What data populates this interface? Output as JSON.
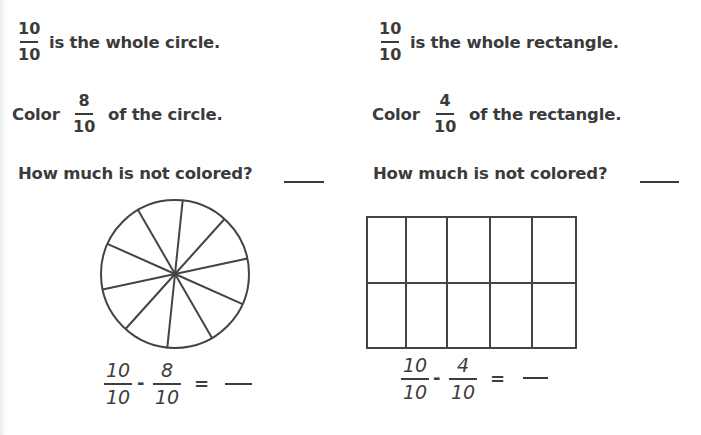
{
  "left": {
    "whole": {
      "numerator": "10",
      "denominator": "10",
      "text": "is the whole circle."
    },
    "color": {
      "prefix": "Color",
      "numerator": "8",
      "denominator": "10",
      "suffix": "of the circle."
    },
    "question": "How much is not colored?",
    "shape": {
      "type": "circle",
      "parts": 10
    },
    "equation": {
      "a": {
        "numerator": "10",
        "denominator": "10"
      },
      "minus": "-",
      "b": {
        "numerator": "8",
        "denominator": "10"
      },
      "equals": "="
    }
  },
  "right": {
    "whole": {
      "numerator": "10",
      "denominator": "10",
      "text": "is the whole rectangle."
    },
    "color": {
      "prefix": "Color",
      "numerator": "4",
      "denominator": "10",
      "suffix": "of the rectangle."
    },
    "question": "How much is not colored?",
    "shape": {
      "type": "rectangle",
      "rows": 2,
      "columns": 5,
      "parts": 10
    },
    "equation": {
      "a": {
        "numerator": "10",
        "denominator": "10"
      },
      "minus": "-",
      "b": {
        "numerator": "4",
        "denominator": "10"
      },
      "equals": "="
    }
  },
  "colors": {
    "ink": "#3b3b3b",
    "background": "#ffffff"
  }
}
